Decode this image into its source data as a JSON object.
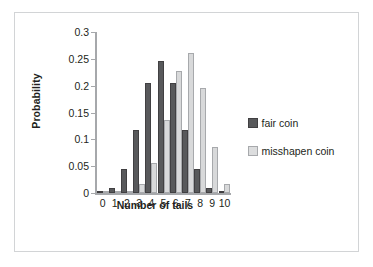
{
  "chart_data": {
    "type": "bar",
    "title": "",
    "xlabel": "Number of tails",
    "ylabel": "Probability",
    "categories": [
      "0",
      "1",
      "2",
      "3",
      "4",
      "5",
      "6",
      "7",
      "8",
      "9",
      "10"
    ],
    "series": [
      {
        "name": "fair coin",
        "color": "#58595b",
        "values": [
          0.001,
          0.01,
          0.044,
          0.117,
          0.205,
          0.246,
          0.205,
          0.117,
          0.044,
          0.01,
          0.001
        ]
      },
      {
        "name": "misshapen coin",
        "color": "#dcddde",
        "values": [
          0.0,
          0.0,
          0.004,
          0.016,
          0.056,
          0.136,
          0.227,
          0.26,
          0.195,
          0.086,
          0.017
        ]
      }
    ],
    "ylim": [
      0,
      0.3
    ],
    "yticks": [
      "0",
      "0.05",
      "0.1",
      "0.15",
      "0.2",
      "0.25",
      "0.3"
    ],
    "ytick_values": [
      0,
      0.05,
      0.1,
      0.15,
      0.2,
      0.25,
      0.3
    ],
    "grid": false,
    "legend_position": "right"
  },
  "legend": {
    "items": [
      {
        "label": "fair coin",
        "swatch": "fair"
      },
      {
        "label": "misshapen coin",
        "swatch": "misshapen"
      }
    ]
  }
}
